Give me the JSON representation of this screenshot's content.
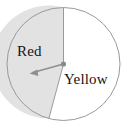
{
  "figure": {
    "name": "spinner-diagram",
    "type": "probability-spinner",
    "width": 127,
    "height": 133
  },
  "spinner": {
    "center_x": 63.5,
    "center_y": 64,
    "radius": 56.5,
    "outline_color": "#9a9a9a",
    "outline_width": 1,
    "pointer": {
      "name": "spinner-arrow",
      "color": "#8f8f8f",
      "tip_x": 30,
      "tip_y": 73,
      "hub_radius": 2.6,
      "hub_color": "#8a8a8a"
    },
    "sectors": [
      {
        "label": "Red",
        "fill": "#e2e2e2",
        "start_angle_deg": 0,
        "end_angle_deg": 195,
        "direction": "counterclockwise",
        "label_x": 17,
        "label_y": 44
      },
      {
        "label": "Yellow",
        "fill": "#ffffff",
        "start_angle_deg": 195,
        "end_angle_deg": 360,
        "direction": "counterclockwise",
        "label_x": 64,
        "label_y": 72
      }
    ],
    "divider_color": "#9a9a9a"
  }
}
